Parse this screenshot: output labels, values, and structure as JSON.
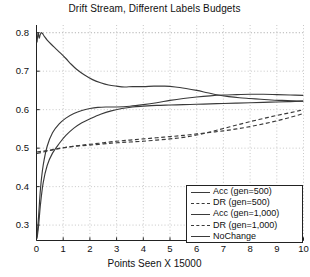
{
  "chart_data": {
    "type": "line",
    "title": "Drift Stream, Different Labels Budgets",
    "xlabel": "Points Seen X 15000",
    "ylabel": "",
    "xlim": [
      0,
      10
    ],
    "ylim": [
      0.26,
      0.82
    ],
    "grid": true,
    "grid_style": "dotted",
    "legend_position": "lower right",
    "xticks": [
      0,
      1,
      2,
      3,
      4,
      5,
      6,
      7,
      8,
      9,
      10
    ],
    "xtick_labels": [
      "0",
      "1",
      "2",
      "3",
      "4",
      "5",
      "6",
      "7",
      "8",
      "9",
      "10"
    ],
    "yticks": [
      0.3,
      0.4,
      0.5,
      0.6,
      0.7,
      0.8
    ],
    "ytick_labels": [
      "0.3",
      "0.4",
      "0.5",
      "0.6",
      "0.7",
      "0.8"
    ],
    "line_color": "#3a3a3a",
    "series": [
      {
        "name": "Acc (gen=500)",
        "style": "solid",
        "color": "#3a3a3a",
        "x": [
          0.02,
          0.08,
          0.15,
          0.25,
          0.4,
          0.6,
          0.85,
          1.1,
          1.4,
          1.7,
          2.0,
          2.4,
          2.8,
          3.2,
          3.6,
          4.0,
          4.5,
          5.0,
          5.5,
          6.0,
          6.5,
          7.0,
          7.5,
          8.0,
          8.5,
          9.0,
          9.5,
          10.0
        ],
        "y": [
          0.265,
          0.3,
          0.355,
          0.41,
          0.455,
          0.487,
          0.512,
          0.533,
          0.552,
          0.566,
          0.576,
          0.588,
          0.597,
          0.603,
          0.607,
          0.609,
          0.611,
          0.612,
          0.613,
          0.614,
          0.615,
          0.616,
          0.617,
          0.618,
          0.619,
          0.62,
          0.621,
          0.622
        ]
      },
      {
        "name": "DR (gen=500)",
        "style": "dashed",
        "color": "#3a3a3a",
        "x": [
          0.02,
          0.2,
          0.5,
          0.8,
          1.2,
          1.6,
          2.0,
          2.5,
          3.0,
          3.5,
          4.0,
          4.5,
          5.0,
          5.5,
          6.0,
          6.5,
          7.0,
          7.5,
          8.0,
          8.5,
          9.0,
          9.5,
          10.0
        ],
        "y": [
          0.49,
          0.492,
          0.495,
          0.499,
          0.503,
          0.506,
          0.508,
          0.511,
          0.514,
          0.516,
          0.518,
          0.521,
          0.524,
          0.528,
          0.534,
          0.542,
          0.551,
          0.56,
          0.569,
          0.577,
          0.585,
          0.592,
          0.6
        ]
      },
      {
        "name": "Acc (gen=1,000)",
        "style": "solid",
        "color": "#3a3a3a",
        "x": [
          0.02,
          0.08,
          0.15,
          0.25,
          0.4,
          0.6,
          0.85,
          1.1,
          1.4,
          1.7,
          2.0,
          2.3,
          2.6,
          3.0,
          3.5,
          4.0,
          4.5,
          5.0,
          5.5,
          6.0,
          6.5,
          7.0,
          7.5,
          8.0,
          8.5,
          9.0,
          9.5,
          10.0
        ],
        "y": [
          0.27,
          0.325,
          0.395,
          0.455,
          0.505,
          0.54,
          0.563,
          0.578,
          0.59,
          0.598,
          0.603,
          0.606,
          0.607,
          0.607,
          0.609,
          0.613,
          0.618,
          0.624,
          0.629,
          0.633,
          0.636,
          0.638,
          0.639,
          0.64,
          0.64,
          0.639,
          0.638,
          0.637
        ]
      },
      {
        "name": "DR (gen=1,000)",
        "style": "dashed",
        "color": "#3a3a3a",
        "x": [
          0.02,
          0.2,
          0.5,
          0.8,
          1.2,
          1.6,
          2.0,
          2.5,
          3.0,
          3.5,
          4.0,
          4.5,
          5.0,
          5.5,
          6.0,
          6.5,
          7.0,
          7.5,
          8.0,
          8.5,
          9.0,
          9.5,
          10.0
        ],
        "y": [
          0.486,
          0.489,
          0.494,
          0.498,
          0.503,
          0.507,
          0.51,
          0.514,
          0.518,
          0.521,
          0.524,
          0.527,
          0.53,
          0.533,
          0.537,
          0.541,
          0.545,
          0.55,
          0.556,
          0.563,
          0.571,
          0.58,
          0.59
        ]
      },
      {
        "name": "NoChange",
        "style": "solid",
        "color": "#3a3a3a",
        "x": [
          0.02,
          0.06,
          0.1,
          0.14,
          0.18,
          0.22,
          0.3,
          0.4,
          0.55,
          0.7,
          0.9,
          1.1,
          1.3,
          1.5,
          1.8,
          2.1,
          2.4,
          2.7,
          3.0,
          3.3,
          3.6,
          4.0,
          4.4,
          4.8,
          5.2,
          5.6,
          6.0,
          6.4,
          6.8,
          7.2,
          7.6,
          8.0,
          8.4,
          8.8,
          9.2,
          9.6,
          10.0
        ],
        "y": [
          0.775,
          0.8,
          0.786,
          0.795,
          0.8,
          0.798,
          0.79,
          0.781,
          0.77,
          0.76,
          0.747,
          0.733,
          0.718,
          0.705,
          0.69,
          0.678,
          0.67,
          0.664,
          0.661,
          0.659,
          0.66,
          0.66,
          0.661,
          0.661,
          0.659,
          0.655,
          0.65,
          0.644,
          0.638,
          0.634,
          0.631,
          0.629,
          0.627,
          0.625,
          0.624,
          0.623,
          0.622
        ]
      }
    ]
  },
  "legend": {
    "entries": [
      {
        "label": "Acc (gen=500)",
        "style": "solid"
      },
      {
        "label": "DR (gen=500)",
        "style": "dashed"
      },
      {
        "label": "Acc (gen=1,000)",
        "style": "solid"
      },
      {
        "label": "DR (gen=1,000)",
        "style": "dashed"
      },
      {
        "label": "NoChange",
        "style": "solid"
      }
    ]
  }
}
